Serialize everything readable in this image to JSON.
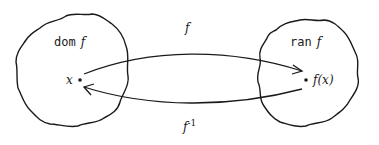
{
  "diagram": {
    "domain_set": {
      "prefix": "dom",
      "name": "f"
    },
    "range_set": {
      "prefix": "ran",
      "name": "f"
    },
    "point_x": "x",
    "point_fx": "f(x)",
    "arrow_forward": "f",
    "arrow_inverse": {
      "base": "f",
      "exponent": "-1"
    },
    "colors": {
      "stroke": "#1a1a1a",
      "background": "#ffffff"
    }
  }
}
